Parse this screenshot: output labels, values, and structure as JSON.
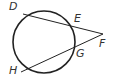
{
  "diagram": {
    "type": "circle-two-secants",
    "circle": {
      "cx": 44,
      "cy": 42,
      "r": 31
    },
    "external_point": {
      "label": "F",
      "x": 103,
      "y": 34
    },
    "points": [
      {
        "label": "D",
        "x": 23,
        "y": 14,
        "lx": 9,
        "ly": 10
      },
      {
        "label": "E",
        "x": 73,
        "y": 26,
        "lx": 74,
        "ly": 22
      },
      {
        "label": "F",
        "x": 103,
        "y": 34,
        "lx": 99,
        "ly": 47
      },
      {
        "label": "G",
        "x": 75,
        "y": 47,
        "lx": 76,
        "ly": 57
      },
      {
        "label": "H",
        "x": 21,
        "y": 72,
        "lx": 9,
        "ly": 74
      }
    ],
    "segments": [
      {
        "from": "D",
        "to": "F"
      },
      {
        "from": "H",
        "to": "F"
      }
    ],
    "colors": {
      "stroke": "#222222",
      "label": "#333333"
    }
  }
}
